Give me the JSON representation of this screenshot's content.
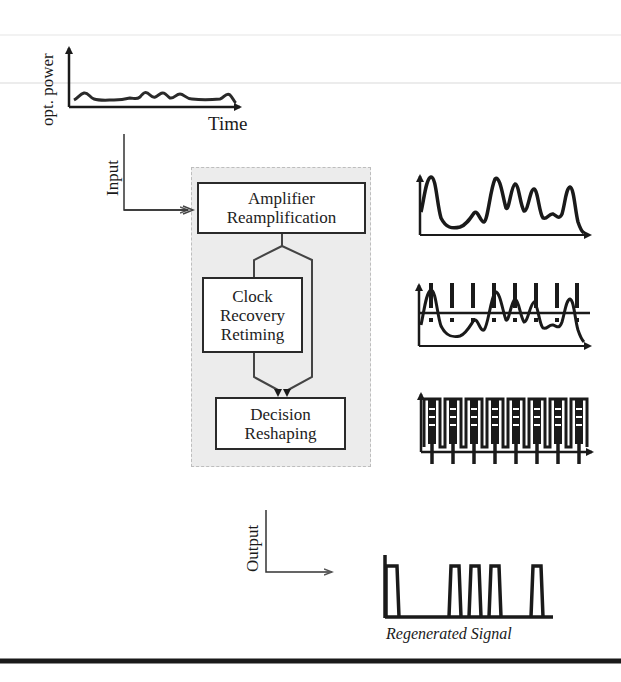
{
  "diagram": {
    "input_panel": {
      "y_label": "opt. power",
      "x_label": "Time"
    },
    "input_label": "Input",
    "output_label": "Output",
    "blocks": [
      {
        "id": "amplifier",
        "lines": [
          "Amplifier",
          "Reamplification"
        ]
      },
      {
        "id": "clock",
        "lines": [
          "Clock",
          "Recovery",
          "Retiming"
        ]
      },
      {
        "id": "decision",
        "lines": [
          "Decision",
          "Reshaping"
        ]
      }
    ],
    "waveforms": [
      {
        "id": "reamplified",
        "description": "amplified noisy signal"
      },
      {
        "id": "retimed",
        "description": "signal with clock sampling markers and threshold"
      },
      {
        "id": "reshaped",
        "description": "reshaped pulse train with decision markers"
      }
    ],
    "output_caption": "Regenerated Signal",
    "regenerated_bits": [
      1,
      0,
      0,
      1,
      1,
      1,
      0,
      1
    ],
    "colors": {
      "panel_bg": "#ececec",
      "line": "#1a1a1a",
      "box_border": "#2a2a2a"
    }
  }
}
